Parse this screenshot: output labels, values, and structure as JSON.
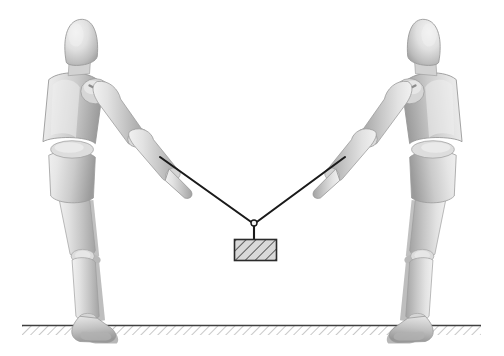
{
  "diagram": {
    "canvas": {
      "width": 504,
      "height": 356,
      "background": "#ffffff"
    },
    "colors": {
      "background": "#ffffff",
      "rope": "#1a1a1a",
      "block_outline": "#2b2b2b",
      "block_fill": "#d8d8d8",
      "block_hatch": "#3a3a3a",
      "ground_line": "#404040",
      "ground_hatch": "#909090",
      "mannequin_light": "#e4e4e4",
      "mannequin_mid": "#c9c9c9",
      "mannequin_dark": "#a6a6a6",
      "mannequin_shadow": "#8c8c8c",
      "mannequin_outline": "#9a9a9a"
    },
    "figures": [
      {
        "id": "mannequin-left",
        "label": "Left mannequin",
        "facing": "right",
        "hand_anchor": {
          "x": 160,
          "y": 157
        },
        "foot_contact": {
          "x": 120,
          "y": 322
        }
      },
      {
        "id": "mannequin-right",
        "label": "Right mannequin",
        "facing": "left",
        "hand_anchor": {
          "x": 345,
          "y": 157
        },
        "foot_contact": {
          "x": 386,
          "y": 322
        }
      }
    ],
    "ropes": [
      {
        "id": "rope-left",
        "label": "Left rope",
        "from": {
          "x": 160,
          "y": 157
        },
        "to": {
          "x": 254,
          "y": 224
        }
      },
      {
        "id": "rope-right",
        "label": "Right rope",
        "from": {
          "x": 345,
          "y": 157
        },
        "to": {
          "x": 254,
          "y": 224
        }
      },
      {
        "id": "rope-vertical",
        "label": "Vertical rope to block",
        "from": {
          "x": 254,
          "y": 224
        },
        "to": {
          "x": 254,
          "y": 240
        }
      }
    ],
    "knot": {
      "id": "rope-junction",
      "label": "Rope junction knot",
      "x": 254,
      "y": 224,
      "radius": 3
    },
    "block": {
      "id": "hanging-block",
      "label": "Hatched suspended block",
      "x": 234,
      "y": 239,
      "width": 42,
      "height": 21,
      "hatch_angle_deg": 45
    },
    "ground": {
      "id": "ground-surface",
      "label": "Hatched ground surface",
      "line_y": 325,
      "x_start": 22,
      "x_end": 481,
      "hatch_depth": 9,
      "hatch_angle_deg": 45
    }
  }
}
